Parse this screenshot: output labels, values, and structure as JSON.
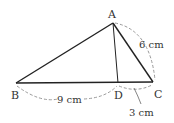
{
  "diagram": {
    "type": "geometry-triangle",
    "points": {
      "A": {
        "label": "A",
        "x": 113,
        "y": 23
      },
      "B": {
        "label": "B",
        "x": 16,
        "y": 83
      },
      "C": {
        "label": "C",
        "x": 153,
        "y": 82
      },
      "D": {
        "label": "D",
        "x": 118,
        "y": 83
      }
    },
    "segments": [
      "AB",
      "AC",
      "BC",
      "AD"
    ],
    "measurements": {
      "AC": "6 cm",
      "BD": "9 cm",
      "DC": "3 cm"
    },
    "colors": {
      "line": "#222222",
      "dash": "#888888",
      "text": "#333333"
    }
  }
}
